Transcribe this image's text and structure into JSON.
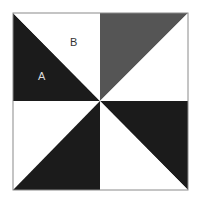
{
  "figure": {
    "type": "pinwheel-square",
    "bounds": {
      "x1": 13,
      "y1": 13,
      "x2": 188,
      "y2": 190
    },
    "center": {
      "x": 100,
      "y": 101
    },
    "colors": {
      "black": "#1b1b1b",
      "gray": "#555555",
      "white": "#ffffff",
      "outline": "#8a8a8a"
    },
    "triangles": [
      {
        "id": "A",
        "quadrant": "top-left",
        "half": "lower-left",
        "fill": "black"
      },
      {
        "id": "B",
        "quadrant": "top-left",
        "half": "upper-right",
        "fill": "white"
      },
      {
        "id": "top-right-left",
        "quadrant": "top-right",
        "half": "upper-left",
        "fill": "gray"
      },
      {
        "id": "top-right-right",
        "quadrant": "top-right",
        "half": "lower-right",
        "fill": "white"
      },
      {
        "id": "bottom-left-left",
        "quadrant": "bottom-left",
        "half": "upper-left",
        "fill": "white"
      },
      {
        "id": "bottom-left-right",
        "quadrant": "bottom-left",
        "half": "lower-right",
        "fill": "black"
      },
      {
        "id": "bottom-right-left",
        "quadrant": "bottom-right",
        "half": "lower-left",
        "fill": "white"
      },
      {
        "id": "bottom-right-right",
        "quadrant": "bottom-right",
        "half": "upper-right",
        "fill": "black"
      }
    ]
  },
  "labels": {
    "a": {
      "text": "A",
      "x": 38,
      "y": 71
    },
    "b": {
      "text": "B",
      "x": 70,
      "y": 37
    }
  }
}
